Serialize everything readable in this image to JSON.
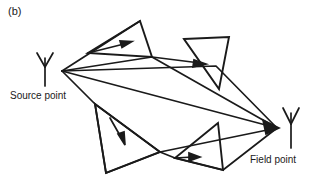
{
  "figure": {
    "panel_label": "(b)",
    "source_label": "Source point",
    "field_label": "Field point",
    "stroke_color": "#1a1a1a",
    "background_color": "#ffffff",
    "source_icon_name": "antenna-icon",
    "field_icon_name": "antenna-icon"
  },
  "diagram_data": {
    "type": "ray-tracing-diagram",
    "description": "Multiple scattering ray paths between a source point antenna and a field point antenna via four triangular scatterers",
    "nodes": [
      {
        "id": "source",
        "label": "Source point",
        "x": 62,
        "y": 71
      },
      {
        "id": "field",
        "label": "Field point",
        "x": 277,
        "y": 128
      }
    ],
    "scatterers": [
      {
        "id": "triangle-top-left",
        "points": "140,21 88,53 152,57"
      },
      {
        "id": "triangle-top-right",
        "points": "184,39 229,37 219,89"
      },
      {
        "id": "triangle-bottom-left",
        "points": "95,104 160,152 106,173"
      },
      {
        "id": "triangle-bottom-right",
        "points": "218,123 175,158 223,170"
      }
    ],
    "rays": [
      {
        "id": "ray-direct",
        "from": "source",
        "to": "field",
        "path": "62,71 277,128",
        "arrow": true
      },
      {
        "id": "ray-upper-1",
        "from": "source",
        "to": "field",
        "path": "62,71 117,47 187,64 277,128",
        "arrow": true
      },
      {
        "id": "ray-upper-2",
        "from": "source",
        "to": "field",
        "path": "62,71 152,57 213,90 277,128",
        "arrow": true
      },
      {
        "id": "ray-lower-1",
        "from": "source",
        "to": "field",
        "path": "62,71 95,104 142,153 277,128",
        "arrow": true
      },
      {
        "id": "ray-lower-2",
        "from": "source",
        "to": "field",
        "path": "62,71 106,173 168,160 277,128",
        "arrow": true
      }
    ],
    "arrow_markers": [
      {
        "id": "arrow-top-left-triangle",
        "x": 124,
        "y": 45,
        "angle": -20
      },
      {
        "id": "arrow-top-right-triangle",
        "x": 204,
        "y": 62,
        "angle": -22
      },
      {
        "id": "arrow-bottom-left-triangle",
        "x": 123,
        "y": 140,
        "angle": 72
      },
      {
        "id": "arrow-bottom-right-triangle",
        "x": 192,
        "y": 158,
        "angle": 2
      },
      {
        "id": "arrow-field-convergence",
        "x": 272,
        "y": 127,
        "angle": 15
      }
    ]
  }
}
